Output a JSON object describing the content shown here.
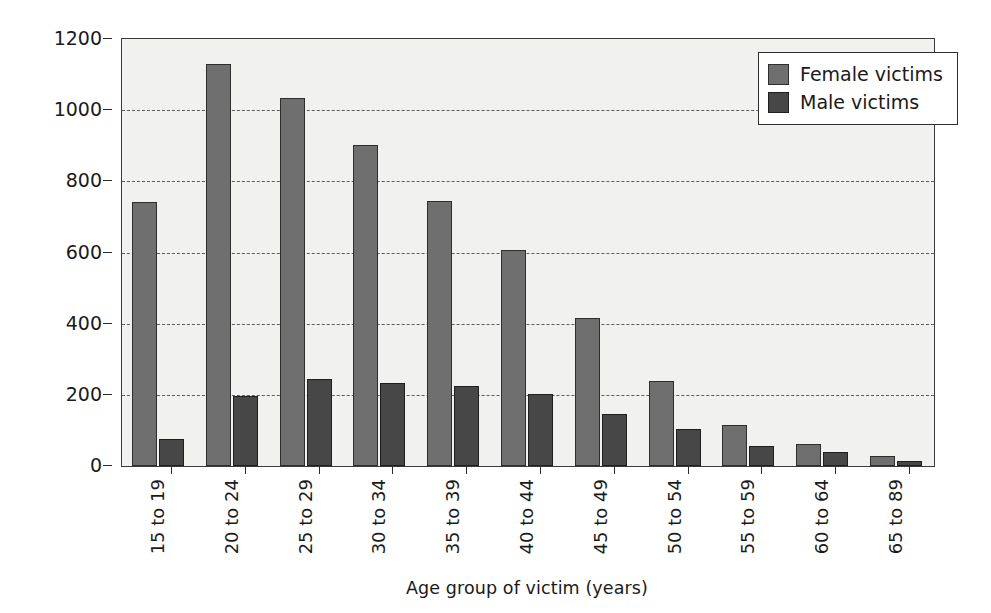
{
  "chart_data": {
    "type": "bar",
    "title": "",
    "xlabel": "Age group of victim (years)",
    "ylabel": "Rate per 100 000 population",
    "categories": [
      "15 to 19",
      "20 to 24",
      "25 to 29",
      "30 to 34",
      "35 to 39",
      "40 to 44",
      "45 to 49",
      "50 to 54",
      "55 to 59",
      "60 to 64",
      "65 to 89"
    ],
    "series": [
      {
        "name": "Female victims",
        "color": "#6f6f6f",
        "values": [
          742,
          1130,
          1035,
          903,
          745,
          607,
          417,
          238,
          114,
          62,
          27
        ]
      },
      {
        "name": "Male victims",
        "color": "#474747",
        "values": [
          76,
          197,
          245,
          234,
          224,
          203,
          146,
          104,
          57,
          38,
          13
        ]
      }
    ],
    "ylim": [
      0,
      1200
    ],
    "yticks": [
      0,
      200,
      400,
      600,
      800,
      1000,
      1200
    ],
    "ytick_labels": [
      "0",
      "200",
      "400",
      "600",
      "800",
      "1000",
      "1200"
    ],
    "grid": "horizontal-dashed",
    "legend_position": "top-right",
    "plot_background": "#f1f1ef",
    "annotations": []
  },
  "legend": {
    "entries": [
      {
        "label": "Female victims",
        "swatch": "female-swatch"
      },
      {
        "label": "Male victims",
        "swatch": "male-swatch"
      }
    ]
  }
}
